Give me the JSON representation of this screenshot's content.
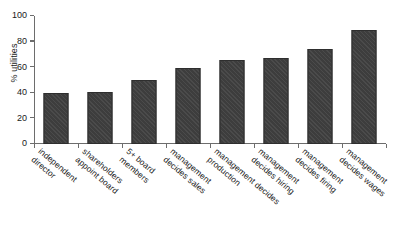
{
  "chart_data": {
    "type": "bar",
    "title": "",
    "subtitle": "",
    "xlabel": "",
    "ylabel": "% utilities",
    "ylim": [
      0,
      100
    ],
    "yticks": [
      0,
      20,
      40,
      60,
      80,
      100
    ],
    "grid": false,
    "legend": false,
    "orientation": "vertical",
    "bar_color": "#3d3d3d",
    "categories": [
      "independent director",
      "shareholders appoint board",
      "5+ board members",
      "management decides sales",
      "management decides production",
      "management decides hiring",
      "management decides firing",
      "management decides wages"
    ],
    "category_lines": [
      [
        "independent",
        "director"
      ],
      [
        "shareholders",
        "appoint board"
      ],
      [
        "5+ board",
        "members"
      ],
      [
        "management",
        "decides sales"
      ],
      [
        "management decides",
        "production"
      ],
      [
        "management",
        "decides hiring"
      ],
      [
        "management",
        "decides firing"
      ],
      [
        "management",
        "decides wages"
      ]
    ],
    "values": [
      40,
      41,
      50,
      59,
      66,
      67,
      74,
      89
    ]
  }
}
